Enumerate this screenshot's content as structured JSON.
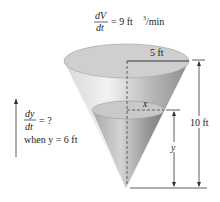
{
  "diagram": {
    "rate_given": {
      "numerator": "dV",
      "denominator": "dt",
      "equals": "= 9 ft",
      "exponent": "3",
      "units": "/min"
    },
    "rate_unknown": {
      "numerator": "dy",
      "denominator": "dt",
      "equals": "= ?",
      "condition": "when y = 6 ft"
    },
    "labels": {
      "radius": "5 ft",
      "height": "10 ft",
      "water_radius": "x",
      "water_height": "y"
    },
    "colors": {
      "cone_light": "#e6e6e6",
      "cone_dark": "#9a9a9a",
      "water": "#c4c4c4",
      "line": "#333333"
    }
  }
}
